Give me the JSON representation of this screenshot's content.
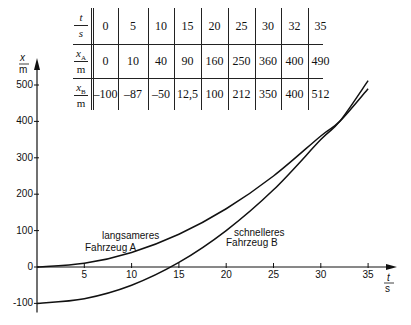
{
  "chart_data": {
    "type": "line",
    "title": "",
    "xlabel": {
      "num": "t",
      "den": "s"
    },
    "ylabel": {
      "num": "x",
      "den": "m"
    },
    "xlim": [
      0,
      37
    ],
    "ylim": [
      -120,
      530
    ],
    "x_ticks": [
      5,
      10,
      15,
      20,
      25,
      30,
      35
    ],
    "y_ticks": [
      -100,
      0,
      100,
      200,
      300,
      400,
      500
    ],
    "grid": false,
    "series": [
      {
        "name": "langsameres Fahrzeug A",
        "label_line1": "langsameres",
        "label_line2": "Fahrzeug A",
        "x": [
          0,
          5,
          10,
          15,
          20,
          25,
          30,
          32,
          35
        ],
        "values": [
          0,
          10,
          40,
          90,
          160,
          250,
          360,
          400,
          490
        ]
      },
      {
        "name": "schnelleres Fahrzeug B",
        "label_line1": "schnelleres",
        "label_line2": "Fahrzeug B",
        "x": [
          0,
          5,
          10,
          15,
          20,
          25,
          30,
          32,
          35
        ],
        "values": [
          -100,
          -87,
          -50,
          12.5,
          100,
          212,
          350,
          400,
          512
        ]
      }
    ],
    "table": {
      "row_headers": [
        {
          "num": "t",
          "den": "s"
        },
        {
          "num": "x_A",
          "den": "m"
        },
        {
          "num": "x_B",
          "den": "m"
        }
      ],
      "rows": [
        [
          "0",
          "5",
          "10",
          "15",
          "20",
          "25",
          "30",
          "32",
          "35"
        ],
        [
          "0",
          "10",
          "40",
          "90",
          "160",
          "250",
          "360",
          "400",
          "490"
        ],
        [
          "-100",
          "-87",
          "-50",
          "12,5",
          "100",
          "212",
          "350",
          "400",
          "512"
        ]
      ]
    }
  }
}
